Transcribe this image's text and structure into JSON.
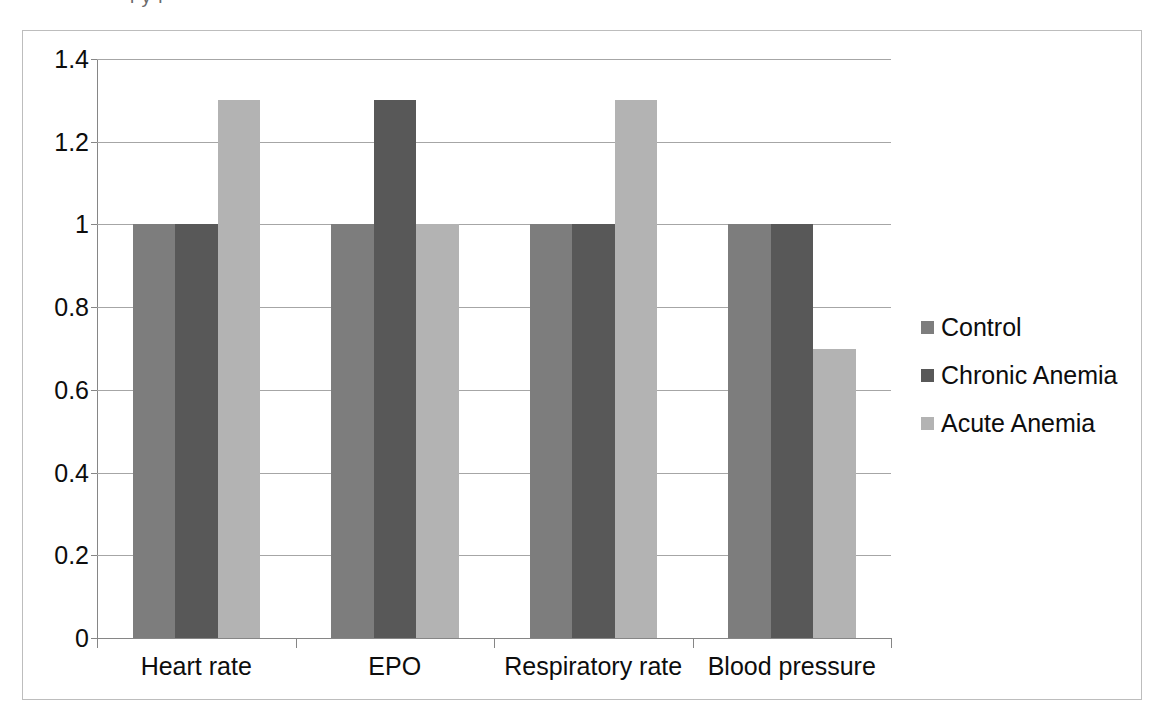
{
  "chart_data": {
    "type": "bar",
    "title": "",
    "subtitle": "",
    "xlabel": "",
    "ylabel": "",
    "categories": [
      "Heart rate",
      "EPO",
      "Respiratory rate",
      "Blood pressure"
    ],
    "series": [
      {
        "name": "Control",
        "values": [
          1,
          1,
          1,
          1
        ],
        "color": "#7d7d7d"
      },
      {
        "name": "Chronic Anemia",
        "values": [
          1,
          1.3,
          1,
          1
        ],
        "color": "#585858"
      },
      {
        "name": "Acute Anemia",
        "values": [
          1.3,
          1,
          1.3,
          0.7
        ],
        "color": "#b3b3b3"
      }
    ],
    "ylim": [
      0,
      1.4
    ],
    "ytick_values": [
      1.4,
      1.2,
      1,
      0.8,
      0.6,
      0.4,
      0.2,
      0
    ],
    "ytick_labels": [
      "1.4",
      "1.2",
      "1",
      "0.8",
      "0.6",
      "0.4",
      "0.2",
      "0"
    ],
    "ytick_step": 0.2,
    "grid": true,
    "grid_axis": "y",
    "legend_position": "right",
    "bar_orientation": "vertical",
    "group_count": 4,
    "bars_per_group": 3
  },
  "legend": {
    "items": [
      {
        "label": "Control",
        "color": "#7d7d7d"
      },
      {
        "label": "Chronic Anemia",
        "color": "#585858"
      },
      {
        "label": "Acute Anemia",
        "color": "#b3b3b3"
      }
    ]
  },
  "axes": {
    "y": {
      "labels": [
        "1.4",
        "1.2",
        "1",
        "0.8",
        "0.6",
        "0.4",
        "0.2",
        "0"
      ]
    },
    "x": {
      "labels": [
        "Heart rate",
        "EPO",
        "Respiratory rate",
        "Blood pressure"
      ]
    }
  },
  "style": {
    "plot_background": "#ffffff",
    "frame_border": "#bdbdbd",
    "gridline_color": "#a6a6a6",
    "axis_color": "#868686",
    "text_color": "#0d0d0d"
  },
  "artifacts": {
    "top_crop_remnant": "l  y  l"
  }
}
